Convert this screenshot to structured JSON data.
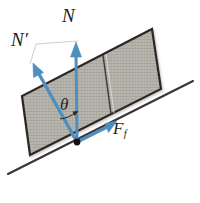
{
  "figure": {
    "background_color": "#ffffff",
    "labels": {
      "normal_force": "N",
      "normal_force_prime_base": "N",
      "normal_force_prime_mark": "′",
      "angle": "θ",
      "friction_force_base": "F",
      "friction_force_sub": "f"
    },
    "colors": {
      "vector_blue": "#4e8fc0",
      "vector_blue_dark": "#3d7caf",
      "block_fill": "#b9b6af",
      "block_hatch": "#9d9a93",
      "block_outline": "#2b2724",
      "incline_line": "#3a3532",
      "label_text": "#221e1c",
      "origin_dot": "#14110f",
      "bracket_white": "#ffffff"
    },
    "geometry": {
      "incline_start": [
        8,
        174
      ],
      "incline_end": [
        193,
        81
      ],
      "origin_point": [
        77,
        142
      ],
      "normal_vector_tip": [
        76,
        44
      ],
      "normal_prime_vector_tip": [
        33,
        67
      ],
      "friction_vector_tip": [
        115,
        117
      ],
      "angle_degrees": 27
    },
    "elements": [
      {
        "name": "incline-surface-line",
        "kind": "line"
      },
      {
        "name": "block-body",
        "kind": "hatched-parallelogram"
      },
      {
        "name": "block-divider-line",
        "kind": "line"
      },
      {
        "name": "normal-force-vector",
        "kind": "arrow",
        "label": "N"
      },
      {
        "name": "normal-prime-force-vector",
        "kind": "arrow",
        "label": "N′"
      },
      {
        "name": "friction-force-vector",
        "kind": "arrow",
        "label": "F_f"
      },
      {
        "name": "angle-arc",
        "kind": "arc",
        "label": "θ"
      },
      {
        "name": "origin-dot",
        "kind": "dot"
      },
      {
        "name": "bracket-connector",
        "kind": "bracket"
      }
    ]
  }
}
